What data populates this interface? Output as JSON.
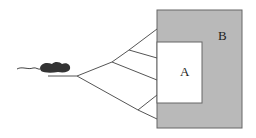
{
  "diagram": {
    "labels": {
      "inner_box": "A",
      "outer_box": "B"
    },
    "colors": {
      "outer_fill": "#b9b9b9",
      "inner_fill": "#ffffff",
      "stroke": "#555555",
      "mouse": "#333333"
    },
    "elements": [
      "mouse",
      "start-line",
      "branching-paths",
      "outer-box-B",
      "inner-box-A"
    ]
  }
}
